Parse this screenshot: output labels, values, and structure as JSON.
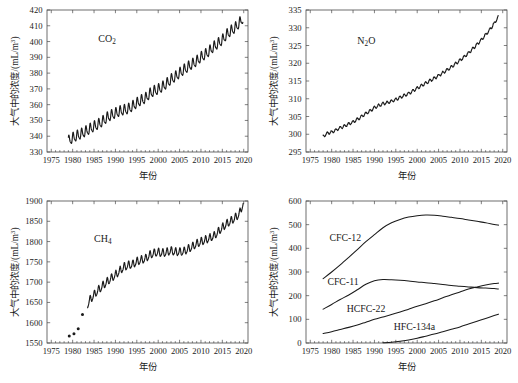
{
  "figure": {
    "panel_count": 4,
    "shared_xlabel": "年份",
    "shared_ylabel": "大气中的浓度/(mL/m3)",
    "ylabel_main": "大气中的浓度/(mL/m",
    "ylabel_sup": "3",
    "ylabel_tail": ")",
    "line_color": "#1a1a1a",
    "frame_color": "#4a4a4a",
    "background": "#ffffff"
  },
  "chart_data": [
    {
      "id": "co2",
      "type": "line",
      "title": "CO2",
      "title_base": "CO",
      "title_sub": "2",
      "xlabel": "年份",
      "ylabel": "大气中的浓度/(mL/m3)",
      "xlim": [
        1974,
        2021
      ],
      "ylim": [
        330,
        420
      ],
      "xticks": [
        1975,
        1980,
        1985,
        1990,
        1995,
        2000,
        2005,
        2010,
        2015,
        2020
      ],
      "yticks": [
        330,
        340,
        350,
        360,
        370,
        380,
        390,
        400,
        410,
        420
      ],
      "grid": false,
      "legend": "none",
      "annotation_pos": {
        "x": 1986,
        "y": 400
      },
      "seasonal_amplitude": 3.0,
      "x": [
        1979.0,
        1980.0,
        1981.0,
        1982.0,
        1983.0,
        1984.0,
        1985.0,
        1986.0,
        1987.0,
        1988.0,
        1989.0,
        1990.0,
        1991.0,
        1992.0,
        1993.0,
        1994.0,
        1995.0,
        1996.0,
        1997.0,
        1998.0,
        1999.0,
        2000.0,
        2001.0,
        2002.0,
        2003.0,
        2004.0,
        2005.0,
        2006.0,
        2007.0,
        2008.0,
        2009.0,
        2010.0,
        2011.0,
        2012.0,
        2013.0,
        2014.0,
        2015.0,
        2016.0,
        2017.0,
        2018.0,
        2019.0,
        2019.8
      ],
      "values": [
        336.8,
        338.7,
        340.1,
        341.3,
        342.8,
        344.4,
        346.0,
        347.4,
        349.2,
        351.6,
        353.1,
        354.4,
        355.6,
        356.4,
        357.1,
        358.8,
        360.8,
        362.6,
        363.8,
        366.7,
        368.4,
        369.5,
        371.1,
        373.2,
        375.8,
        377.5,
        379.8,
        381.9,
        383.8,
        385.6,
        387.4,
        389.9,
        391.6,
        393.9,
        396.5,
        398.6,
        400.8,
        404.2,
        406.6,
        408.5,
        411.6,
        414.5
      ],
      "unit": "mL/m3"
    },
    {
      "id": "n2o",
      "type": "line",
      "title": "N2O",
      "title_base_a": "N",
      "title_sub": "2",
      "title_base_b": "O",
      "xlabel": "年份",
      "ylabel": "大气中的浓度/(mL/m3)",
      "xlim": [
        1974,
        2021
      ],
      "ylim": [
        295,
        335
      ],
      "xticks": [
        1975,
        1980,
        1985,
        1990,
        1995,
        2000,
        2005,
        2010,
        2015,
        2020
      ],
      "yticks": [
        295,
        300,
        305,
        310,
        315,
        320,
        325,
        330,
        335
      ],
      "grid": false,
      "legend": "none",
      "annotation_pos": {
        "x": 1986,
        "y": 325.5
      },
      "x": [
        1978.0,
        1979.0,
        1980.0,
        1981.0,
        1982.0,
        1983.0,
        1984.0,
        1985.0,
        1986.0,
        1987.0,
        1988.0,
        1989.0,
        1990.0,
        1991.0,
        1992.0,
        1993.0,
        1994.0,
        1995.0,
        1996.0,
        1997.0,
        1998.0,
        1999.0,
        2000.0,
        2001.0,
        2002.0,
        2003.0,
        2004.0,
        2005.0,
        2006.0,
        2007.0,
        2008.0,
        2009.0,
        2010.0,
        2011.0,
        2012.0,
        2013.0,
        2014.0,
        2015.0,
        2016.0,
        2017.0,
        2018.0,
        2019.0
      ],
      "values": [
        299.4,
        300.3,
        300.6,
        301.2,
        301.8,
        302.3,
        302.9,
        303.5,
        304.2,
        305.0,
        305.8,
        306.6,
        307.5,
        308.1,
        308.6,
        308.9,
        309.3,
        309.8,
        310.4,
        310.9,
        311.5,
        312.2,
        313.0,
        313.7,
        314.4,
        315.1,
        315.8,
        316.5,
        317.3,
        318.1,
        319.0,
        319.9,
        320.8,
        321.8,
        322.9,
        324.1,
        325.3,
        326.6,
        328.0,
        329.5,
        331.2,
        333.2
      ],
      "unit": "mL/m3"
    },
    {
      "id": "ch4",
      "type": "line",
      "title": "CH4",
      "title_base": "CH",
      "title_sub": "4",
      "xlabel": "年份",
      "ylabel": "大气中的浓度/(mL/m3)",
      "xlim": [
        1974,
        2021
      ],
      "ylim": [
        1550,
        1900
      ],
      "xticks": [
        1975,
        1980,
        1985,
        1990,
        1995,
        2000,
        2005,
        2010,
        2015,
        2020
      ],
      "yticks": [
        1550,
        1600,
        1650,
        1700,
        1750,
        1800,
        1850,
        1900
      ],
      "grid": false,
      "legend": "none",
      "annotation_pos": {
        "x": 1985,
        "y": 1800
      },
      "seasonal_amplitude": 9.0,
      "scatter_x": [
        1979.2,
        1980.3,
        1981.3,
        1982.3
      ],
      "scatter_values": [
        1567,
        1573,
        1585,
        1620
      ],
      "x": [
        1983.5,
        1984.0,
        1985.0,
        1986.0,
        1987.0,
        1988.0,
        1989.0,
        1990.0,
        1991.0,
        1992.0,
        1993.0,
        1994.0,
        1995.0,
        1996.0,
        1997.0,
        1998.0,
        1999.0,
        2000.0,
        2001.0,
        2002.0,
        2003.0,
        2004.0,
        2005.0,
        2006.0,
        2007.0,
        2008.0,
        2009.0,
        2010.0,
        2011.0,
        2012.0,
        2013.0,
        2014.0,
        2015.0,
        2016.0,
        2017.0,
        2018.0,
        2019.0,
        2019.9
      ],
      "values": [
        1645,
        1655,
        1668,
        1680,
        1690,
        1700,
        1709,
        1717,
        1727,
        1737,
        1741,
        1743,
        1750,
        1754,
        1757,
        1766,
        1771,
        1773,
        1771,
        1773,
        1777,
        1774,
        1774,
        1775,
        1781,
        1787,
        1794,
        1799,
        1803,
        1808,
        1813,
        1823,
        1834,
        1843,
        1850,
        1858,
        1868,
        1895
      ],
      "unit": "mL/m3"
    },
    {
      "id": "halocarbons",
      "type": "line",
      "title": "Halocarbons",
      "xlabel": "年份",
      "ylabel": "大气中的浓度/(mL/m3)",
      "xlim": [
        1974,
        2021
      ],
      "ylim": [
        0,
        600
      ],
      "xticks": [
        1975,
        1980,
        1985,
        1990,
        1995,
        2000,
        2005,
        2010,
        2015,
        2020
      ],
      "yticks": [
        0,
        100,
        200,
        300,
        400,
        500,
        600
      ],
      "grid": false,
      "legend": "inline-labels",
      "series": [
        {
          "name": "CFC-12",
          "label_pos": {
            "x": 1979.5,
            "y": 432
          },
          "x": [
            1978,
            1980,
            1982,
            1984,
            1986,
            1988,
            1990,
            1992,
            1994,
            1996,
            1998,
            2000,
            2002,
            2004,
            2006,
            2008,
            2010,
            2012,
            2014,
            2016,
            2018,
            2019
          ],
          "values": [
            272,
            300,
            330,
            362,
            395,
            428,
            458,
            487,
            508,
            522,
            532,
            538,
            541,
            540,
            536,
            531,
            526,
            520,
            514,
            508,
            501,
            498
          ]
        },
        {
          "name": "CFC-11",
          "label_pos": {
            "x": 1979.0,
            "y": 243
          },
          "x": [
            1978,
            1980,
            1982,
            1984,
            1986,
            1988,
            1990,
            1992,
            1994,
            1996,
            1998,
            2000,
            2002,
            2004,
            2006,
            2008,
            2010,
            2012,
            2014,
            2016,
            2018,
            2019
          ],
          "values": [
            143,
            163,
            184,
            203,
            225,
            248,
            263,
            268,
            267,
            265,
            262,
            258,
            255,
            251,
            247,
            243,
            240,
            237,
            234,
            232,
            230,
            228
          ]
        },
        {
          "name": "HCFC-22",
          "label_pos": {
            "x": 1983.5,
            "y": 131
          },
          "x": [
            1978,
            1980,
            1982,
            1984,
            1986,
            1988,
            1990,
            1992,
            1994,
            1996,
            1998,
            2000,
            2002,
            2004,
            2006,
            2008,
            2010,
            2012,
            2014,
            2016,
            2018,
            2019
          ],
          "values": [
            40,
            48,
            57,
            66,
            76,
            88,
            100,
            110,
            120,
            131,
            143,
            155,
            166,
            178,
            191,
            204,
            216,
            228,
            237,
            245,
            251,
            253
          ]
        },
        {
          "name": "HFC-134a",
          "label_pos": {
            "x": 1994.5,
            "y": 55
          },
          "x": [
            1992,
            1994,
            1996,
            1998,
            2000,
            2002,
            2004,
            2006,
            2008,
            2010,
            2012,
            2014,
            2016,
            2018,
            2019
          ],
          "values": [
            1,
            3,
            7,
            13,
            20,
            29,
            38,
            48,
            58,
            68,
            80,
            92,
            104,
            116,
            122
          ]
        }
      ],
      "unit": "mL/m3"
    }
  ]
}
